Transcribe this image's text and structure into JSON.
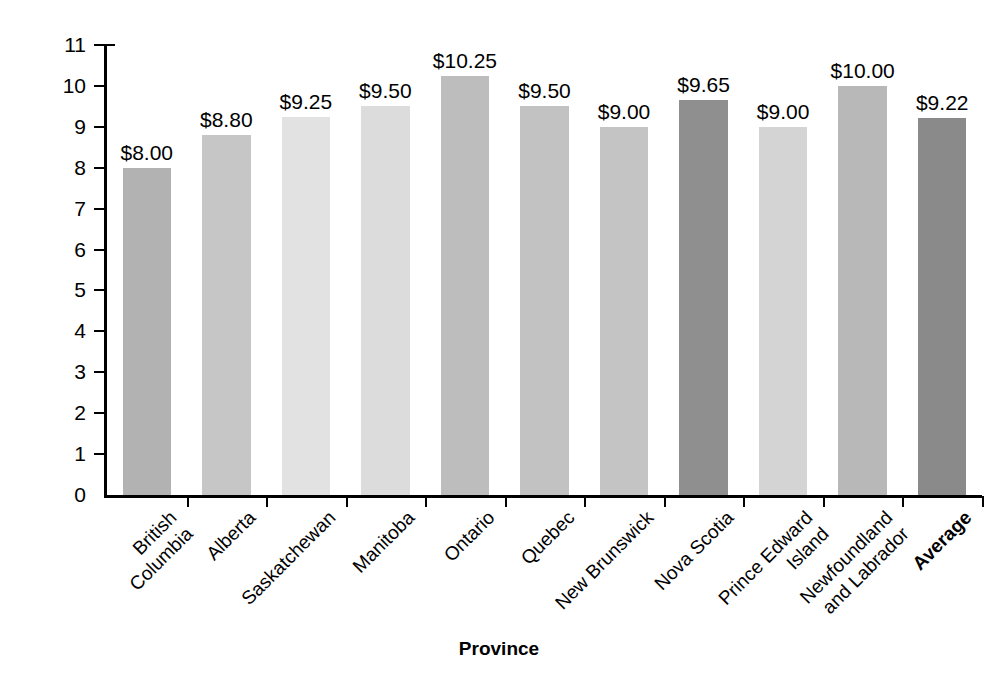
{
  "chart_data": {
    "type": "bar",
    "title": "",
    "xlabel": "Province",
    "ylabel": "Minimum Wage per Hour ($)",
    "ylim": [
      0,
      11
    ],
    "ytick_step": 1,
    "grid": false,
    "legend": "none",
    "categories": [
      "British Columbia",
      "Alberta",
      "Saskatchewan",
      "Manitoba",
      "Ontario",
      "Quebec",
      "New Brunswick",
      "Nova Scotia",
      "Prince Edward Island",
      "Newfoundland and Labrador",
      "Average"
    ],
    "category_lines": [
      [
        "British",
        "Columbia"
      ],
      [
        "Alberta"
      ],
      [
        "Saskatchewan"
      ],
      [
        "Manitoba"
      ],
      [
        "Ontario"
      ],
      [
        "Quebec"
      ],
      [
        "New Brunswick"
      ],
      [
        "Nova Scotia"
      ],
      [
        "Prince Edward",
        "Island"
      ],
      [
        "Newfoundland",
        "and Labrador"
      ],
      [
        "Average"
      ]
    ],
    "values": [
      8.0,
      8.8,
      9.25,
      9.5,
      10.25,
      9.5,
      9.0,
      9.65,
      9.0,
      10.0,
      9.22
    ],
    "value_labels": [
      "$8.00",
      "$8.80",
      "$9.25",
      "$9.50",
      "$10.25",
      "$9.50",
      "$9.00",
      "$9.65",
      "$9.00",
      "$10.00",
      "$9.22"
    ],
    "bar_colors": [
      "#b2b2b2",
      "#c6c6c6",
      "#e2e2e2",
      "#dcdcdc",
      "#bdbdbd",
      "#c2c2c2",
      "#c4c4c4",
      "#8f8f8f",
      "#d4d4d4",
      "#b8b8b8",
      "#8a8a8a"
    ],
    "ytick_labels": [
      "0",
      "1",
      "2",
      "3",
      "4",
      "5",
      "6",
      "7",
      "8",
      "9",
      "10",
      "11"
    ],
    "bold_categories": [
      "Average"
    ]
  },
  "axis": {
    "axis_color": "#000000"
  }
}
